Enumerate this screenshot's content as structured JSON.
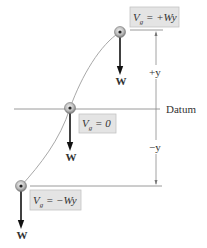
{
  "diagram": {
    "title": "",
    "colors": {
      "label_box_fill": "#e4e4e4",
      "label_box_stroke": "#bdbdbd",
      "line": "#999999",
      "curve": "#a0a0a0",
      "arrow": "#111111",
      "text": "#333333"
    },
    "datum_label": "Datum",
    "dimension_labels": {
      "plus_y": "+y",
      "minus_y": "−y"
    },
    "positions": [
      {
        "name": "top",
        "label_prefix": "V",
        "label_sub": "g",
        "label_rhs": " = +Wy",
        "weight_label": "W"
      },
      {
        "name": "middle",
        "label_prefix": "V",
        "label_sub": "g",
        "label_rhs": " = 0",
        "weight_label": "W"
      },
      {
        "name": "bottom",
        "label_prefix": "V",
        "label_sub": "g",
        "label_rhs": " = −Wy",
        "weight_label": "W"
      }
    ]
  }
}
